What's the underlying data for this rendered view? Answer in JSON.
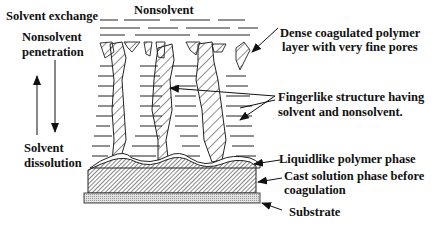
{
  "diagram": {
    "labels": {
      "solvent_exchange": "Solvent exchange",
      "nonsolvent": "Nonsolvent",
      "nonsolvent_penetration_line1": "Nonsolvent",
      "nonsolvent_penetration_line2": "penetration",
      "solvent_dissolution_line1": "Solvent",
      "solvent_dissolution_line2": "dissolution",
      "dense_layer_line1": "Dense coagulated  polymer",
      "dense_layer_line2": "layer with very fine pores",
      "fingerlike_line1": "Fingerlike structure having",
      "fingerlike_line2": "solvent and nonsolvent.",
      "liquidlike": "Liquidlike polymer phase",
      "cast_solution_line1": "Cast solution phase before",
      "cast_solution_line2": "coagulation",
      "substrate": "Substrate"
    },
    "colors": {
      "ink": "#111111",
      "substrate_fill": "#cfcfcf",
      "background": "#ffffff"
    }
  }
}
